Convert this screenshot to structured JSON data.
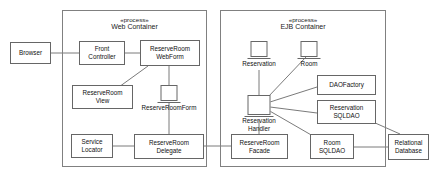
{
  "diagram": {
    "containers": [
      {
        "id": "web-container",
        "stereotype": "«process»",
        "name": "Web Container"
      },
      {
        "id": "ejb-container",
        "stereotype": "«process»",
        "name": "EJB Container"
      }
    ],
    "nodes": [
      {
        "id": "browser",
        "kind": "box",
        "lines": [
          "Browser"
        ]
      },
      {
        "id": "front-controller",
        "kind": "box",
        "lines": [
          "Front",
          "Controller"
        ]
      },
      {
        "id": "reserveroom-webform",
        "kind": "box",
        "lines": [
          "ReserveRoom",
          "WebForm"
        ]
      },
      {
        "id": "reserveroom-view",
        "kind": "box",
        "lines": [
          "ReserveRoom",
          "View"
        ]
      },
      {
        "id": "reserveroomform",
        "kind": "bean",
        "lines": [
          "ReserveRoomForm"
        ]
      },
      {
        "id": "service-locator",
        "kind": "box",
        "lines": [
          "Service",
          "Locator"
        ]
      },
      {
        "id": "reserveroom-delegate",
        "kind": "box",
        "lines": [
          "ReserveRoom",
          "Delegate"
        ]
      },
      {
        "id": "reserveroom-facade",
        "kind": "box",
        "lines": [
          "ReserveRoom",
          "Facade"
        ]
      },
      {
        "id": "reservation",
        "kind": "bean",
        "lines": [
          "Reservation"
        ]
      },
      {
        "id": "room",
        "kind": "bean",
        "lines": [
          "Room"
        ]
      },
      {
        "id": "reservation-handler",
        "kind": "bean",
        "lines": [
          "Reservation",
          "Handler"
        ]
      },
      {
        "id": "daofactory",
        "kind": "box",
        "lines": [
          "DAOFactory"
        ]
      },
      {
        "id": "reservation-sqldao",
        "kind": "box",
        "lines": [
          "Reservation",
          "SQLDAO"
        ]
      },
      {
        "id": "room-sqldao",
        "kind": "box",
        "lines": [
          "Room",
          "SQLDAO"
        ]
      },
      {
        "id": "relational-database",
        "kind": "box",
        "lines": [
          "Relational",
          "Database"
        ]
      }
    ],
    "connections": [
      {
        "from": "browser",
        "to": "front-controller"
      },
      {
        "from": "front-controller",
        "to": "reserveroom-webform"
      },
      {
        "from": "reserveroom-webform",
        "to": "reserveroom-view"
      },
      {
        "from": "reserveroom-webform",
        "to": "reserveroomform"
      },
      {
        "from": "reserveroomform",
        "to": "reserveroom-delegate"
      },
      {
        "from": "service-locator",
        "to": "reserveroom-delegate"
      },
      {
        "from": "reserveroom-delegate",
        "to": "reserveroom-facade"
      },
      {
        "from": "reserveroom-facade",
        "to": "reservation-handler"
      },
      {
        "from": "reservation-handler",
        "to": "reservation"
      },
      {
        "from": "reservation-handler",
        "to": "room"
      },
      {
        "from": "reservation-handler",
        "to": "daofactory"
      },
      {
        "from": "reservation-handler",
        "to": "reservation-sqldao"
      },
      {
        "from": "reservation-handler",
        "to": "room-sqldao"
      },
      {
        "from": "reservation-sqldao",
        "to": "relational-database"
      },
      {
        "from": "room-sqldao",
        "to": "relational-database"
      }
    ],
    "colors": {
      "stroke": "#666666",
      "container_stroke": "#808080",
      "text": "#111111",
      "background": "#ffffff"
    }
  }
}
